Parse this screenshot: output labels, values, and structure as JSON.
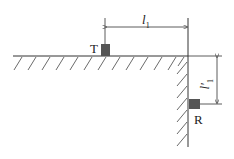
{
  "diagram": {
    "transmitter_label": "T",
    "receiver_label": "R",
    "dim_horizontal": {
      "symbol": "l",
      "subscript": "1"
    },
    "dim_vertical": {
      "symbol": "l′",
      "subscript": "1"
    },
    "colors": {
      "line": "#333333",
      "block": "#555555",
      "hatch": "#444444"
    }
  }
}
